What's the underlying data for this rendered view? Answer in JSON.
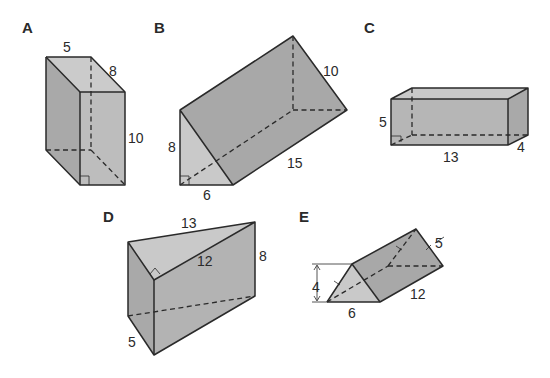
{
  "colors": {
    "background": "#ffffff",
    "face_light": "#c9c9c9",
    "face_mid": "#b3b3b3",
    "face_dark": "#a5a5a5",
    "edge": "#2a2a2a"
  },
  "shapes": [
    {
      "id": "A",
      "label": "A",
      "type": "rectangular prism",
      "dimensions": {
        "top_width": "5",
        "top_depth": "8",
        "height": "10"
      }
    },
    {
      "id": "B",
      "label": "B",
      "type": "triangular prism",
      "dimensions": {
        "triangle_height": "8",
        "triangle_base": "6",
        "length": "15",
        "hypotenuse": "10"
      }
    },
    {
      "id": "C",
      "label": "C",
      "type": "rectangular prism",
      "dimensions": {
        "height": "5",
        "length": "13",
        "depth": "4"
      }
    },
    {
      "id": "D",
      "label": "D",
      "type": "triangular prism",
      "dimensions": {
        "hypotenuse": "13",
        "leg": "12",
        "height": "8",
        "short_leg": "5"
      }
    },
    {
      "id": "E",
      "label": "E",
      "type": "triangular prism",
      "dimensions": {
        "triangle_height": "4",
        "triangle_base": "6",
        "length": "12",
        "slant": "5"
      }
    }
  ]
}
